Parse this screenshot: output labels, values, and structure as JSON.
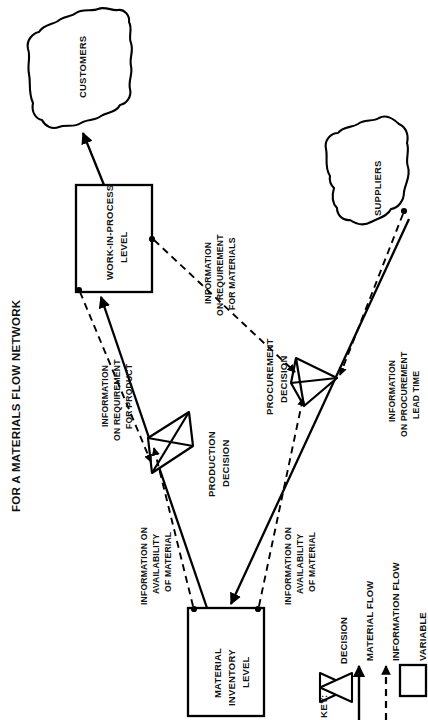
{
  "figure": {
    "title": "FOR A MATERIALS FLOW NETWORK",
    "orientation": "rotated-90-ccw"
  },
  "nodes": {
    "customers": {
      "label": "CUSTOMERS",
      "shape": "cloud"
    },
    "suppliers": {
      "label": "SUPPLIERS",
      "shape": "cloud"
    },
    "work_in_process": {
      "label_line1": "WORK-IN-PROCESS",
      "label_line2": "LEVEL",
      "shape": "box"
    },
    "material_inventory": {
      "label_line1": "MATERIAL",
      "label_line2": "INVENTORY",
      "label_line3": "LEVEL",
      "shape": "box"
    },
    "production_decision": {
      "label_line1": "PRODUCTION",
      "label_line2": "DECISION",
      "shape": "valve"
    },
    "procurement_decision": {
      "label_line1": "PROCUREMENT",
      "label_line2": "DECISION",
      "shape": "valve"
    }
  },
  "flow_labels": {
    "req_materials": {
      "line1": "INFORMATION",
      "line2": "ON REQUIREMENT",
      "line3": "FOR MATERIALS"
    },
    "req_product": {
      "line1": "INFORMATION",
      "line2": "ON REQUIREMENT",
      "line3": "FOR PRODUCT"
    },
    "avail_material_left": {
      "line1": "INFORMATION ON",
      "line2": "AVAILABILITY",
      "line3": "OF MATERIAL"
    },
    "avail_material_right": {
      "line1": "INFORMATION ON",
      "line2": "AVAILABILITY",
      "line3": "OF MATERIAL"
    },
    "procurement_lead_time": {
      "line1": "INFORMATION",
      "line2": "ON PROCUREMENT",
      "line3": "LEAD TIME"
    }
  },
  "key": {
    "header": "KEY:",
    "items": [
      {
        "symbol": "valve",
        "label": "DECISION"
      },
      {
        "symbol": "solid-arrow",
        "label": "MATERIAL FLOW"
      },
      {
        "symbol": "dashed-arrow",
        "label": "INFORMATION FLOW"
      },
      {
        "symbol": "box",
        "label": "VARIABLE"
      }
    ]
  },
  "colors": {
    "ink": "#000000",
    "paper": "#ffffff"
  }
}
